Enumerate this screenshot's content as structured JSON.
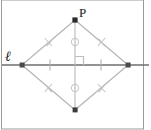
{
  "figure": {
    "type": "geometry-diagram",
    "width": 151,
    "height": 130,
    "background_color": "#ffffff",
    "border_color": "#9a9a9a",
    "labels": {
      "point_p": "P",
      "line_l": "ℓ"
    },
    "colors": {
      "main_line": "#6e6e6e",
      "construction_line": "#b9b9b9",
      "tick_mark": "#c9c9c9",
      "point_fill": "#2a2a2a",
      "right_angle": "#bdbdbd",
      "label": "#1a1a1a"
    },
    "points": [
      {
        "name": "P",
        "role": "apex-top",
        "x": 75,
        "y": 20,
        "marked": true,
        "label": "P"
      },
      {
        "name": "left-vertex",
        "role": "intersection-left",
        "x": 22,
        "y": 65,
        "marked": true,
        "label": ""
      },
      {
        "name": "right-vertex",
        "role": "intersection-right",
        "x": 128,
        "y": 65,
        "marked": true,
        "label": ""
      },
      {
        "name": "bottom-vertex",
        "role": "apex-bottom",
        "x": 75,
        "y": 110,
        "marked": true,
        "label": ""
      },
      {
        "name": "center",
        "role": "midpoint",
        "x": 75,
        "y": 65,
        "marked": false,
        "label": ""
      }
    ],
    "line_l": {
      "y": 65,
      "x_start": 2,
      "x_end": 149,
      "label": "ℓ"
    },
    "vertical_line": {
      "x": 75,
      "y_start": 20,
      "y_end": 110
    },
    "rhombus_edges": [
      {
        "name": "top-left-edge",
        "from": "P",
        "to": "left-vertex",
        "ticks": 2
      },
      {
        "name": "top-right-edge",
        "from": "P",
        "to": "right-vertex",
        "ticks": 2
      },
      {
        "name": "bottom-left-edge",
        "from": "left-vertex",
        "to": "bottom-vertex",
        "ticks": 2
      },
      {
        "name": "bottom-right-edge",
        "from": "right-vertex",
        "to": "bottom-vertex",
        "ticks": 2
      }
    ],
    "congruence_marks": {
      "horizontal_single_ticks": 2,
      "vertical_circle_marks": 2,
      "edge_double_ticks": 4,
      "right_angle_markers": 1
    }
  }
}
